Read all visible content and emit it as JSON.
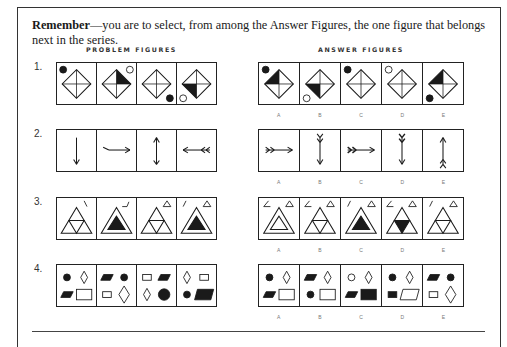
{
  "instruction": {
    "bold": "Remember",
    "text": "—you are to select, from among the Answer Figures, the one figure that belongs next in the series."
  },
  "headers": {
    "problem": "PROBLEM FIGURES",
    "answer": "ANSWER FIGURES"
  },
  "answer_labels": [
    "A",
    "B",
    "C",
    "D",
    "E"
  ],
  "rows": [
    {
      "number": "1.",
      "type": "diamond-quadrant",
      "problem": [
        {
          "dot": "filled",
          "dot_pos": "top-left",
          "fill": "none"
        },
        {
          "dot": "open",
          "dot_pos": "top-right",
          "fill": "top-right"
        },
        {
          "dot": "filled",
          "dot_pos": "bottom-right",
          "fill": "none"
        },
        {
          "dot": "open",
          "dot_pos": "bottom-left",
          "fill": "bottom-left"
        }
      ],
      "answers": [
        {
          "dot": "filled",
          "dot_pos": "top-left",
          "fill": "top-left"
        },
        {
          "dot": "open",
          "dot_pos": "bottom-left",
          "fill": "bottom-left"
        },
        {
          "dot": "filled",
          "dot_pos": "top-left",
          "fill": "none"
        },
        {
          "dot": "open",
          "dot_pos": "top-left",
          "fill": "none"
        },
        {
          "dot": "filled",
          "dot_pos": "bottom-left",
          "fill": "top-left"
        }
      ]
    },
    {
      "number": "2.",
      "type": "arrow",
      "problem": [
        {
          "dir": "down",
          "tail": "none"
        },
        {
          "dir": "right",
          "tail": "bent"
        },
        {
          "dir": "up",
          "tail": "single-feather"
        },
        {
          "dir": "left",
          "tail": "double-feather"
        }
      ],
      "answers": [
        {
          "dir": "right",
          "tail": "double-feather"
        },
        {
          "dir": "down",
          "tail": "double-feather"
        },
        {
          "dir": "right",
          "tail": "double-feather-bold"
        },
        {
          "dir": "down",
          "tail": "double-feather-bold"
        },
        {
          "dir": "up",
          "tail": "double-feather"
        }
      ]
    },
    {
      "number": "3.",
      "type": "triangle",
      "problem": [
        {
          "main": "subdivided",
          "mark": "backslash",
          "small_tri": false
        },
        {
          "main": "nested-black",
          "mark": "angle",
          "small_tri": false
        },
        {
          "main": "subdivided",
          "mark": "none",
          "small_tri": true
        },
        {
          "main": "nested-black",
          "mark": "slash",
          "small_tri": true
        }
      ],
      "answers": [
        {
          "main": "nested-open",
          "mark": "angle",
          "small_tri": true
        },
        {
          "main": "subdivided",
          "mark": "angle",
          "small_tri": true
        },
        {
          "main": "nested-black",
          "mark": "slash",
          "small_tri": true
        },
        {
          "main": "subdivided-center-black",
          "mark": "angle",
          "small_tri": true
        },
        {
          "main": "subdivided",
          "mark": "slash",
          "small_tri": true
        }
      ]
    },
    {
      "number": "4.",
      "type": "shapes-grid",
      "problem": [
        [
          "dot-filled",
          "diamond-open",
          "para-filled",
          "rect-open-large"
        ],
        [
          "para-filled",
          "dot-filled",
          "rect-open-small",
          "diamond-open-large"
        ],
        [
          "rect-open-small",
          "para-filled",
          "diamond-open",
          "dot-filled-large"
        ],
        [
          "diamond-open",
          "rect-open-small",
          "dot-filled",
          "para-filled-large"
        ]
      ],
      "answers": [
        [
          "dot-filled",
          "diamond-open",
          "para-filled",
          "rect-open-large"
        ],
        [
          "para-filled",
          "diamond-open",
          "dot-filled",
          "rect-open-large"
        ],
        [
          "dot-open",
          "diamond-open",
          "para-filled",
          "rect-filled-large"
        ],
        [
          "dot-filled",
          "diamond-open",
          "rect-filled-small",
          "para-open-large"
        ],
        [
          "para-filled",
          "dot-filled",
          "rect-open-small",
          "diamond-open-large"
        ]
      ]
    }
  ]
}
